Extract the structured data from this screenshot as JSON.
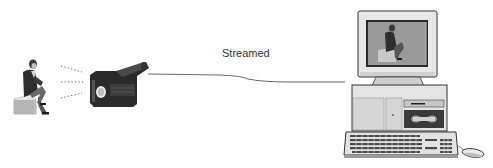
{
  "diagram": {
    "title": "",
    "nodes": [
      {
        "id": "presenter",
        "kind": "person-seated-on-box",
        "label": ""
      },
      {
        "id": "camcorder",
        "kind": "video-camera",
        "label": ""
      },
      {
        "id": "computer",
        "kind": "desktop-computer-with-monitor-keyboard-mouse",
        "label": ""
      }
    ],
    "edges": [
      {
        "from": "presenter",
        "to": "camcorder",
        "style": "dotted-rays",
        "label": ""
      },
      {
        "from": "camcorder",
        "to": "computer",
        "style": "solid-line",
        "label": "Streamed"
      }
    ],
    "stream_label": "Streamed"
  },
  "colors": {
    "background": "#ffffff",
    "line": "#6a6a6a",
    "label": "#333333",
    "dark": "#2a2a2a",
    "mid": "#8a8a8a",
    "light": "#d8d8d8",
    "beige": "#e4e4e4"
  },
  "icons": {
    "presenter": "person-icon",
    "camcorder": "camcorder-icon",
    "computer": "computer-icon",
    "monitor": "monitor-icon",
    "keyboard": "keyboard-icon",
    "mouse": "mouse-icon"
  }
}
